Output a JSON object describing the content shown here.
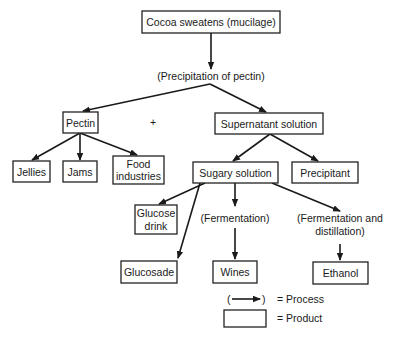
{
  "diagram": {
    "source": {
      "label": "Cocoa sweatens (mucilage)"
    },
    "process_precipitation": {
      "label": "(Precipitation of pectin)"
    },
    "pectin": {
      "label": "Pectin"
    },
    "plus": {
      "label": "+"
    },
    "supernatant": {
      "label": "Supernatant solution"
    },
    "jellies": {
      "label": "Jellies"
    },
    "jams": {
      "label": "Jams"
    },
    "food_industries": {
      "line1": "Food",
      "line2": "industries"
    },
    "sugary_solution": {
      "label": "Sugary solution"
    },
    "precipitant": {
      "label": "Precipitant"
    },
    "glucose_drink": {
      "line1": "Glucose",
      "line2": "drink"
    },
    "process_fermentation": {
      "label": "(Fermentation)"
    },
    "process_ferm_distill": {
      "line1": "(Fermentation and",
      "line2": "distillation)"
    },
    "glucosade": {
      "label": "Glucosade"
    },
    "wines": {
      "label": "Wines"
    },
    "ethanol": {
      "label": "Ethanol"
    }
  },
  "legend": {
    "process_symbol_open": "(",
    "process_symbol_close": ")",
    "process_label": "= Process",
    "product_label": "= Product"
  },
  "colors": {
    "line": "#1a1a1a",
    "box_fill": "#ffffff"
  }
}
